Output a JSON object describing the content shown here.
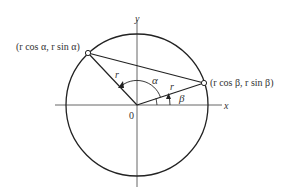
{
  "diagram": {
    "axes": {
      "x_label": "x",
      "y_label": "y",
      "origin_label": "0"
    },
    "circle": {
      "cx": 137,
      "cy": 105,
      "r": 71
    },
    "point_alpha": {
      "x": 88,
      "y": 53,
      "label": "(r cos α, r sin α)"
    },
    "point_beta": {
      "x": 204,
      "y": 83,
      "label": "(r cos β, r sin β)"
    },
    "radius_label": "r",
    "angle_alpha_label": "α",
    "angle_beta_label": "β",
    "colors": {
      "stroke": "#222222",
      "axis": "#444444",
      "text": "#333333"
    }
  }
}
